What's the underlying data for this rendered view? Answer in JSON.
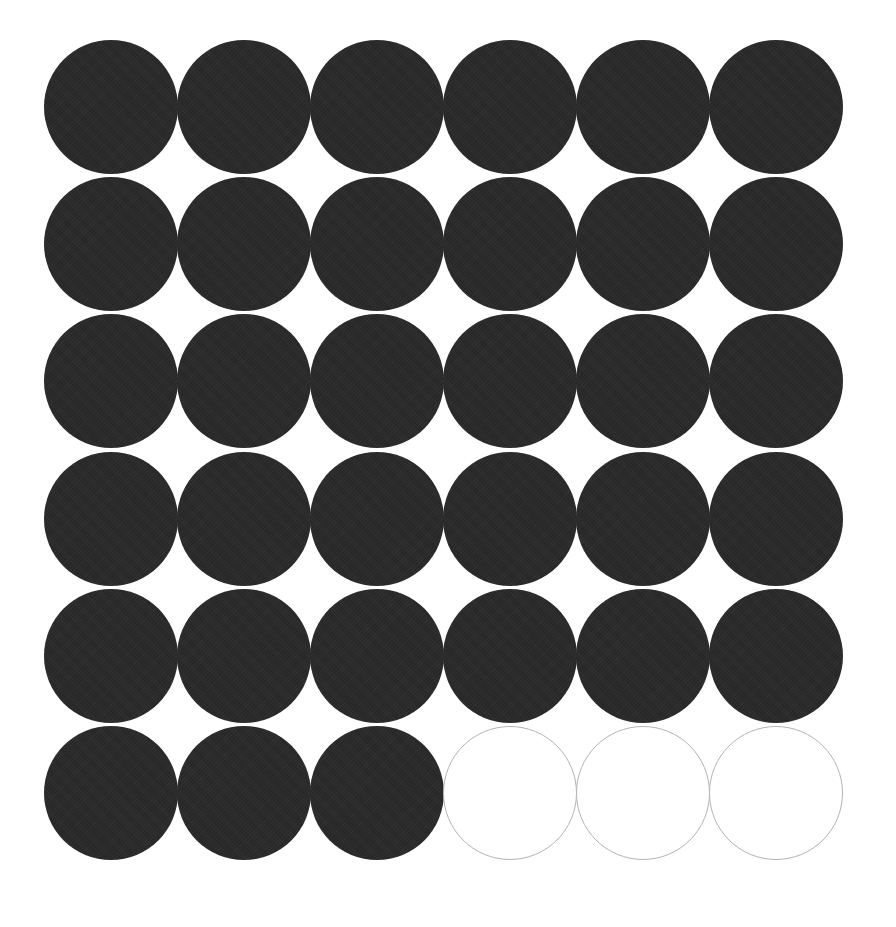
{
  "page": {
    "background_color": "#ffffff"
  },
  "diagram": {
    "name": "circle-grid",
    "rows": 6,
    "columns": 6,
    "total_circles": 36,
    "filled_count": 33,
    "empty_count": 3,
    "filled_color": "#262626",
    "empty_fill_color": "#ffffff",
    "empty_stroke_color": "#b4b4b4",
    "circle_diameter_px": 134,
    "column_pitch_px": 133,
    "row_pitch_px": 137,
    "origin_x_px": 44,
    "origin_y_px": 38,
    "cells": [
      [
        "filled",
        "filled",
        "filled",
        "filled",
        "filled",
        "filled"
      ],
      [
        "filled",
        "filled",
        "filled",
        "filled",
        "filled",
        "filled"
      ],
      [
        "filled",
        "filled",
        "filled",
        "filled",
        "filled",
        "filled"
      ],
      [
        "filled",
        "filled",
        "filled",
        "filled",
        "filled",
        "filled"
      ],
      [
        "filled",
        "filled",
        "filled",
        "filled",
        "filled",
        "filled"
      ],
      [
        "filled",
        "filled",
        "filled",
        "empty",
        "empty",
        "empty"
      ]
    ]
  },
  "chart_data": {
    "type": "table",
    "title": "",
    "xlabel": "",
    "ylabel": "",
    "categories": [
      "filled",
      "empty"
    ],
    "values": [
      33,
      3
    ],
    "grid": true,
    "legend": "none"
  }
}
